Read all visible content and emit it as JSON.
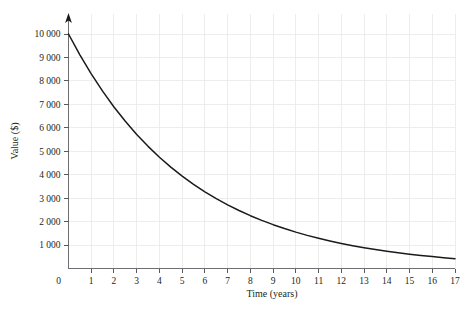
{
  "chart_data": {
    "type": "line",
    "title": "",
    "xlabel": "Time (years)",
    "ylabel": "Value ($)",
    "xlim": [
      0,
      17
    ],
    "ylim": [
      0,
      10400
    ],
    "grid": true,
    "legend": false,
    "curve_color": "#1a1a1a",
    "grid_color": "#e8e8ea",
    "axis_color": "#6d6e71",
    "xticks": [
      0,
      1,
      2,
      3,
      4,
      5,
      6,
      7,
      8,
      9,
      10,
      11,
      12,
      13,
      14,
      15,
      16,
      17
    ],
    "xtick_labels": [
      "0",
      "1",
      "2",
      "3",
      "4",
      "5",
      "6",
      "7",
      "8",
      "9",
      "10",
      "11",
      "12",
      "13",
      "14",
      "15",
      "16",
      "17"
    ],
    "yticks": [
      1000,
      2000,
      3000,
      4000,
      5000,
      6000,
      7000,
      8000,
      9000,
      10000
    ],
    "ytick_labels": [
      "1 000",
      "2 000",
      "3 000",
      "4 000",
      "5 000",
      "6 000",
      "7 000",
      "8 000",
      "9 000",
      "10 000"
    ],
    "series": [
      {
        "name": "Value",
        "x": [
          0,
          0.5,
          1,
          1.5,
          2,
          2.5,
          3,
          3.5,
          4,
          4.5,
          5,
          5.5,
          6,
          6.5,
          7,
          7.5,
          8,
          8.5,
          9,
          9.5,
          10,
          10.5,
          11,
          11.5,
          12,
          12.5,
          13,
          13.5,
          14,
          14.5,
          15,
          15.5,
          16,
          16.5,
          17
        ],
        "values": [
          10000,
          9110,
          8300,
          7562,
          6889,
          6276,
          5718,
          5209,
          4746,
          4324,
          3939,
          3589,
          3269,
          2978,
          2714,
          2472,
          2252,
          2052,
          1869,
          1703,
          1551,
          1413,
          1288,
          1173,
          1069,
          974,
          887,
          808,
          736,
          671,
          611,
          557,
          507,
          462,
          421
        ]
      }
    ]
  }
}
